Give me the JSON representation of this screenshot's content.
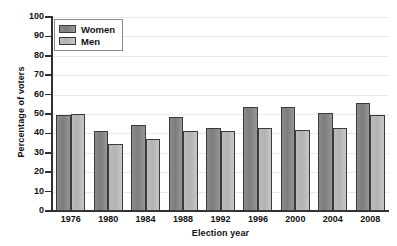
{
  "chart_data": {
    "type": "bar",
    "title": "",
    "xlabel": "Election year",
    "ylabel": "Percentage of voters",
    "categories": [
      "1976",
      "1980",
      "1984",
      "1988",
      "1992",
      "1996",
      "2000",
      "2004",
      "2008"
    ],
    "series": [
      {
        "name": "Women",
        "color": "#848484",
        "values": [
          49.5,
          41.5,
          44.5,
          48.5,
          43.0,
          53.5,
          53.5,
          50.5,
          55.5
        ]
      },
      {
        "name": "Men",
        "color": "#bbbbbb",
        "values": [
          50.0,
          34.5,
          37.0,
          41.5,
          41.5,
          43.0,
          42.0,
          43.0,
          49.5
        ]
      }
    ],
    "ylim": [
      0,
      100
    ],
    "ytick_values": [
      0,
      10,
      20,
      30,
      40,
      50,
      60,
      70,
      80,
      90,
      100
    ],
    "ytick_labels": [
      "0",
      "10",
      "20",
      "30",
      "40",
      "50",
      "60",
      "70",
      "80",
      "90",
      "100"
    ],
    "grid": true,
    "grid_axis": "y",
    "grid_color": "#eceae8",
    "legend_position": "top-left",
    "axis_color": "#303030",
    "background": "#ffffff"
  }
}
